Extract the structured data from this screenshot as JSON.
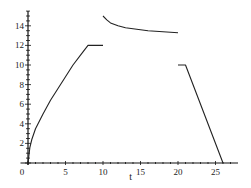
{
  "chart_data": {
    "type": "line",
    "title": "",
    "xlabel": "t",
    "ylabel": "",
    "xlim": [
      -1,
      28
    ],
    "ylim": [
      0,
      15.5
    ],
    "grid": false,
    "legend": null,
    "x_ticks": [
      0,
      5,
      10,
      15,
      20,
      25
    ],
    "x_tick_labels": [
      "0",
      "5",
      "10",
      "15",
      "20",
      "25"
    ],
    "y_ticks": [
      2,
      4,
      6,
      8,
      10,
      12,
      14
    ],
    "y_tick_labels": [
      "2",
      "4",
      "6",
      "8",
      "10",
      "12",
      "14"
    ],
    "series": [
      {
        "name": "segment-1",
        "points": [
          [
            0,
            0
          ],
          [
            0.25,
            1.6
          ],
          [
            0.5,
            2.4
          ],
          [
            1,
            3.5
          ],
          [
            2,
            5
          ],
          [
            3,
            6.4
          ],
          [
            4,
            7.6
          ],
          [
            5,
            8.8
          ],
          [
            6,
            10
          ],
          [
            7,
            11
          ],
          [
            8,
            12
          ],
          [
            10,
            12
          ]
        ]
      },
      {
        "name": "segment-2",
        "points": [
          [
            10,
            15
          ],
          [
            10.5,
            14.6
          ],
          [
            11,
            14.3
          ],
          [
            12,
            14
          ],
          [
            13,
            13.8
          ],
          [
            14,
            13.7
          ],
          [
            15,
            13.6
          ],
          [
            16,
            13.5
          ],
          [
            17,
            13.45
          ],
          [
            18,
            13.4
          ],
          [
            19,
            13.35
          ],
          [
            20,
            13.3
          ]
        ]
      },
      {
        "name": "segment-3",
        "points": [
          [
            20,
            10
          ],
          [
            21,
            10
          ],
          [
            26,
            0
          ]
        ]
      }
    ]
  },
  "axes": {
    "x_label": "t"
  }
}
